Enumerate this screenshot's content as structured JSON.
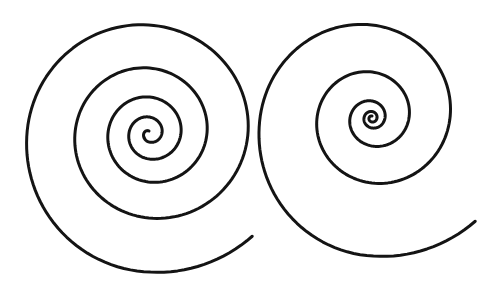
{
  "image": {
    "width": 500,
    "height": 292,
    "background": "#ffffff"
  },
  "spirals": [
    {
      "name": "left-spiral",
      "type": "archimedean-like",
      "center": [
        149,
        133
      ],
      "stroke": "#141414",
      "stroke_width": 3,
      "direction": "counterclockwise-on-screen",
      "radius_table_quarter_turns": {
        "start_k": -3,
        "radii": [
          2,
          5,
          9,
          13,
          16,
          20,
          26,
          32,
          36,
          41,
          49,
          58,
          65,
          74,
          85,
          99,
          108,
          122,
          139
        ],
        "end_k": 15.5,
        "end_r": 146
      }
    },
    {
      "name": "right-spiral",
      "type": "logarithmic-like",
      "center": [
        372,
        118
      ],
      "stroke": "#141414",
      "stroke_width": 3,
      "direction": "counterclockwise-on-screen",
      "radius_table_quarter_turns": {
        "start_k": -3,
        "radii": [
          2,
          3,
          4,
          5,
          6.5,
          8,
          10,
          13,
          17,
          22,
          28,
          37,
          46,
          55,
          65,
          78,
          93,
          112,
          138
        ],
        "end_k": 15.5,
        "end_r": 146
      }
    }
  ]
}
